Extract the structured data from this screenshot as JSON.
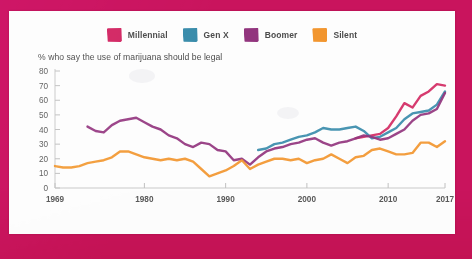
{
  "poster": {
    "border_color": "#c9145d",
    "card_color": "#fdfdfd"
  },
  "legend": {
    "items": [
      {
        "label": "Millennial",
        "color": "#d22a63",
        "swatch_name": "legend-swatch-millennial"
      },
      {
        "label": "Gen X",
        "color": "#3a8cab",
        "swatch_name": "legend-swatch-genx"
      },
      {
        "label": "Boomer",
        "color": "#92357e",
        "swatch_name": "legend-swatch-boomer"
      },
      {
        "label": "Silent",
        "color": "#f2962f",
        "swatch_name": "legend-swatch-silent"
      }
    ]
  },
  "subtitle": "% who say the use of marijuana should be legal",
  "chart_data": {
    "type": "line",
    "title": "",
    "subtitle": "% who say the use of marijuana should be legal",
    "xlabel": "",
    "ylabel": "",
    "xlim": [
      1969,
      2017
    ],
    "ylim": [
      0,
      80
    ],
    "ytick_step": 10,
    "yticks": [
      0,
      10,
      20,
      30,
      40,
      50,
      60,
      70,
      80
    ],
    "ytick_labels": [
      "0",
      "10",
      "20",
      "30",
      "40",
      "50",
      "60",
      "70",
      "80"
    ],
    "xticks": [
      1969,
      1980,
      1990,
      2000,
      2010,
      2017
    ],
    "xtick_labels": [
      "1969",
      "1980",
      "1990",
      "2000",
      "2010",
      "2017"
    ],
    "grid": false,
    "legend_position": "top-center",
    "series": [
      {
        "name": "Millennial",
        "color": "#d22a63",
        "x": [
          2006,
          2007,
          2008,
          2009,
          2010,
          2011,
          2012,
          2013,
          2014,
          2015,
          2016,
          2017
        ],
        "values": [
          34,
          35,
          36,
          37,
          41,
          49,
          58,
          55,
          63,
          66,
          71,
          70
        ]
      },
      {
        "name": "Gen X",
        "color": "#3a8cab",
        "x": [
          1994,
          1995,
          1996,
          1997,
          1998,
          1999,
          2000,
          2001,
          2002,
          2003,
          2004,
          2005,
          2006,
          2007,
          2008,
          2009,
          2010,
          2011,
          2012,
          2013,
          2014,
          2015,
          2016,
          2017
        ],
        "values": [
          26,
          27,
          30,
          31,
          33,
          35,
          36,
          38,
          41,
          40,
          40,
          41,
          42,
          39,
          34,
          35,
          38,
          41,
          47,
          51,
          52,
          53,
          57,
          66
        ]
      },
      {
        "name": "Boomer",
        "color": "#92357e",
        "x": [
          1973,
          1974,
          1975,
          1976,
          1977,
          1978,
          1979,
          1980,
          1981,
          1982,
          1983,
          1984,
          1985,
          1986,
          1987,
          1988,
          1989,
          1990,
          1991,
          1992,
          1993,
          1994,
          1995,
          1996,
          1997,
          1998,
          1999,
          2000,
          2001,
          2002,
          2003,
          2004,
          2005,
          2006,
          2007,
          2008,
          2009,
          2010,
          2011,
          2012,
          2013,
          2014,
          2015,
          2016,
          2017
        ],
        "values": [
          42,
          39,
          38,
          43,
          46,
          47,
          48,
          45,
          42,
          40,
          36,
          34,
          30,
          28,
          31,
          30,
          26,
          25,
          19,
          20,
          16,
          21,
          25,
          27,
          28,
          30,
          31,
          33,
          34,
          31,
          29,
          31,
          32,
          34,
          36,
          35,
          33,
          34,
          37,
          40,
          46,
          50,
          51,
          54,
          65
        ]
      },
      {
        "name": "Silent",
        "color": "#f2962f",
        "x": [
          1969,
          1970,
          1971,
          1972,
          1973,
          1974,
          1975,
          1976,
          1977,
          1978,
          1979,
          1980,
          1981,
          1982,
          1983,
          1984,
          1985,
          1986,
          1987,
          1988,
          1989,
          1990,
          1991,
          1992,
          1993,
          1994,
          1995,
          1996,
          1997,
          1998,
          1999,
          2000,
          2001,
          2002,
          2003,
          2004,
          2005,
          2006,
          2007,
          2008,
          2009,
          2010,
          2011,
          2012,
          2013,
          2014,
          2015,
          2016,
          2017
        ],
        "values": [
          15,
          14,
          14,
          15,
          17,
          18,
          19,
          21,
          25,
          25,
          23,
          21,
          20,
          19,
          20,
          19,
          20,
          18,
          13,
          8,
          10,
          12,
          15,
          19,
          13,
          16,
          18,
          20,
          20,
          19,
          20,
          17,
          19,
          20,
          23,
          20,
          17,
          21,
          22,
          26,
          27,
          25,
          23,
          23,
          24,
          31,
          31,
          28,
          32
        ]
      }
    ]
  }
}
